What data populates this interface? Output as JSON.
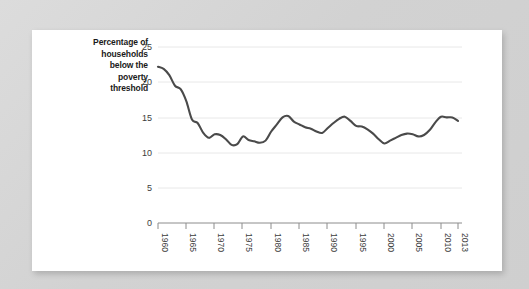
{
  "chart_data": {
    "type": "line",
    "title": "",
    "subtitle": "",
    "ylabel": "Percentage of households below the poverty threshold",
    "ylabel_lines": [
      "Percentage of",
      "households",
      "below the",
      "poverty",
      "threshold"
    ],
    "xlabel": "",
    "xlim": [
      1960,
      2013
    ],
    "ylim": [
      0,
      25
    ],
    "yticks": [
      0,
      5,
      10,
      15,
      20,
      25
    ],
    "ytick_labels": [
      "0",
      "5",
      "10",
      "15",
      "20",
      "25"
    ],
    "xticks": [
      1960,
      1965,
      1970,
      1975,
      1980,
      1985,
      1990,
      1995,
      2000,
      2005,
      2010,
      2013
    ],
    "xtick_labels": [
      "1960",
      "1965",
      "1970",
      "1975",
      "1980",
      "1985",
      "1990",
      "1995",
      "2000",
      "2005",
      "2010",
      "2013"
    ],
    "xtick_rotation": 90,
    "grid": true,
    "grid_axis": "y",
    "legend": false,
    "legend_position": "none",
    "line_color": "#4a4a4a",
    "grid_color": "#e8e8e8",
    "axis_color": "#8c8c8c",
    "background_color": "#ffffff",
    "page_background_color": "#d6d6d6",
    "series": [
      {
        "name": "Percentage of households below the poverty threshold",
        "x": [
          1960,
          1961,
          1962,
          1963,
          1964,
          1965,
          1966,
          1967,
          1968,
          1969,
          1970,
          1971,
          1972,
          1973,
          1974,
          1975,
          1976,
          1977,
          1978,
          1979,
          1980,
          1981,
          1982,
          1983,
          1984,
          1985,
          1986,
          1987,
          1988,
          1989,
          1990,
          1991,
          1992,
          1993,
          1994,
          1995,
          1996,
          1997,
          1998,
          1999,
          2000,
          2001,
          2002,
          2003,
          2004,
          2005,
          2006,
          2007,
          2008,
          2009,
          2010,
          2011,
          2012,
          2013
        ],
        "values": [
          22.2,
          21.9,
          21.0,
          19.5,
          19.0,
          17.3,
          14.7,
          14.2,
          12.8,
          12.1,
          12.6,
          12.5,
          11.9,
          11.1,
          11.2,
          12.3,
          11.8,
          11.6,
          11.4,
          11.7,
          13.0,
          14.0,
          15.0,
          15.2,
          14.4,
          14.0,
          13.6,
          13.4,
          13.0,
          12.8,
          13.5,
          14.2,
          14.8,
          15.1,
          14.5,
          13.8,
          13.7,
          13.3,
          12.7,
          11.9,
          11.3,
          11.7,
          12.1,
          12.5,
          12.7,
          12.6,
          12.3,
          12.5,
          13.2,
          14.3,
          15.1,
          15.0,
          15.0,
          14.5
        ]
      }
    ]
  },
  "figure": {
    "card_label": "chart-card"
  }
}
